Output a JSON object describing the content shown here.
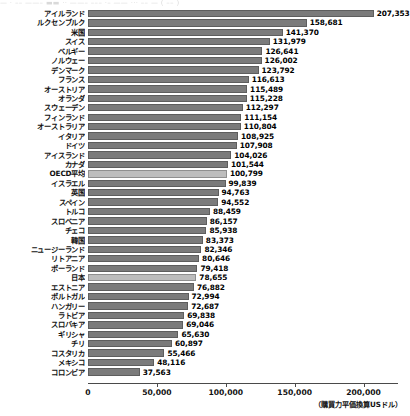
{
  "top_strip": {
    "text": "—  ·   ––   ——–  ▬▬  ··  ——– –––  ·–  ——  ···  ––  —  ( –– )"
  },
  "chart_data": {
    "type": "bar",
    "orientation": "horizontal",
    "title": "",
    "xlabel": "（購買力平価換算USドル）",
    "ylabel": "",
    "xlim": [
      0,
      225000
    ],
    "xticks": [
      0,
      50000,
      100000,
      150000,
      200000
    ],
    "xtick_labels": [
      "0",
      "50,000",
      "100,000",
      "150,000",
      "200,000"
    ],
    "grid": false,
    "legend": "none",
    "value_format": "comma",
    "highlight_color": "#bdbdbd",
    "bar_color": "#7b7b7b",
    "highlighted_categories": [
      "OECD平均",
      "日本"
    ],
    "categories": [
      "アイルランド",
      "ルクセンブルク",
      "米国",
      "スイス",
      "ベルギー",
      "ノルウェー",
      "デンマーク",
      "フランス",
      "オーストリア",
      "オランダ",
      "スウェーデン",
      "フィンランド",
      "オーストラリア",
      "イタリア",
      "ドイツ",
      "アイスランド",
      "カナダ",
      "OECD平均",
      "イスラエル",
      "英国",
      "スペイン",
      "トルコ",
      "スロベニア",
      "チェコ",
      "韓国",
      "ニュージーランド",
      "リトアニア",
      "ポーランド",
      "日本",
      "エストニア",
      "ポルトガル",
      "ハンガリー",
      "ラトビア",
      "スロバキア",
      "ギリシャ",
      "チリ",
      "コスタリカ",
      "メキシコ",
      "コロンビア"
    ],
    "values": [
      207353,
      158681,
      141370,
      131979,
      126641,
      126002,
      123792,
      116613,
      115489,
      115228,
      112297,
      111154,
      110804,
      108925,
      107908,
      104026,
      101544,
      100799,
      99839,
      94763,
      94552,
      88459,
      86157,
      85938,
      83373,
      82346,
      80646,
      79418,
      78655,
      76882,
      72994,
      72687,
      69838,
      69046,
      65630,
      60897,
      55466,
      48116,
      37563
    ],
    "value_labels": [
      "207,353",
      "158,681",
      "141,370",
      "131,979",
      "126,641",
      "126,002",
      "123,792",
      "116,613",
      "115,489",
      "115,228",
      "112,297",
      "111,154",
      "110,804",
      "108,925",
      "107,908",
      "104,026",
      "101,544",
      "100,799",
      "99,839",
      "94,763",
      "94,552",
      "88,459",
      "86,157",
      "85,938",
      "83,373",
      "82,346",
      "80,646",
      "79,418",
      "78,655",
      "76,882",
      "72,994",
      "72,687",
      "69,838",
      "69,046",
      "65,630",
      "60,897",
      "55,466",
      "48,116",
      "37,563"
    ]
  }
}
